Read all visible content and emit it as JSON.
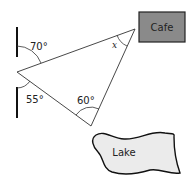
{
  "diagram": {
    "type": "bearings-triangle",
    "places": {
      "cafe": {
        "label": "Cafe",
        "fill": "#8a8a8a"
      },
      "lake": {
        "label": "Lake",
        "fill": "#ebebeb"
      }
    },
    "angles": {
      "top_left": "70°",
      "bottom_left": "55°",
      "bottom_vertex": "60°",
      "cafe_vertex": "x"
    }
  }
}
